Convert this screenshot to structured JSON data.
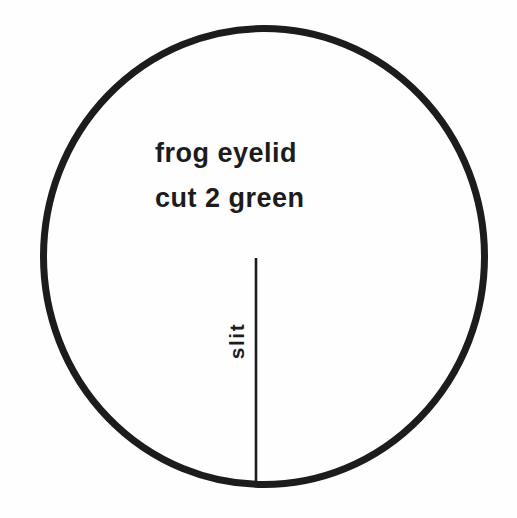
{
  "diagram": {
    "title_line1": "frog eyelid",
    "title_line2": "cut 2 green",
    "slit_label": "slit",
    "piece_count": "2",
    "fabric_color": "green",
    "colors": {
      "ink": "#1c1c1c",
      "background": "#fefefe"
    }
  }
}
